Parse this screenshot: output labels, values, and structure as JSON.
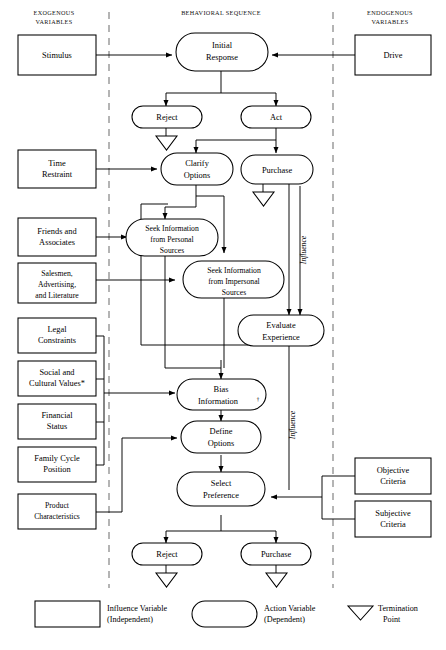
{
  "figure": {
    "columns": {
      "left_header_line1": "EXOGENOUS",
      "left_header_line2": "VARIABLES",
      "center_header": "BEHAVIORAL   SEQUENCE",
      "right_header_line1": "ENDOGENOUS",
      "right_header_line2": "VARIABLES"
    }
  },
  "exogenous_boxes": [
    {
      "id": "stimulus",
      "lines": [
        "Stimulus"
      ]
    },
    {
      "id": "time-restraint",
      "lines": [
        "Time",
        "Restraint"
      ]
    },
    {
      "id": "friends-associates",
      "lines": [
        "Friends  and",
        "Associates"
      ]
    },
    {
      "id": "salesmen-advertising",
      "lines": [
        "Salesmen,",
        "Advertising,",
        "and Literature"
      ]
    },
    {
      "id": "legal-constraints",
      "lines": [
        "Legal",
        "Constraints"
      ]
    },
    {
      "id": "social-cultural-values",
      "lines": [
        "Social  and",
        "Cultural  Values*"
      ]
    },
    {
      "id": "financial-status",
      "lines": [
        "Financial",
        "Status"
      ]
    },
    {
      "id": "family-cycle-position",
      "lines": [
        "Family  Cycle",
        "Position"
      ]
    },
    {
      "id": "product-characteristics",
      "lines": [
        "Product",
        "Characteristics"
      ]
    }
  ],
  "endogenous_boxes": [
    {
      "id": "drive",
      "lines": [
        "Drive"
      ]
    },
    {
      "id": "objective-criteria",
      "lines": [
        "Objective",
        "Criteria"
      ]
    },
    {
      "id": "subjective-criteria",
      "lines": [
        "Subjective",
        "Criteria"
      ]
    }
  ],
  "action_nodes": [
    {
      "id": "initial-response",
      "lines": [
        "Initial",
        "Response"
      ]
    },
    {
      "id": "reject-top",
      "lines": [
        "Reject"
      ]
    },
    {
      "id": "act",
      "lines": [
        "Act"
      ]
    },
    {
      "id": "clarify-options",
      "lines": [
        "Clarify",
        "Options"
      ]
    },
    {
      "id": "purchase-top",
      "lines": [
        "Purchase"
      ]
    },
    {
      "id": "seek-personal",
      "lines": [
        "Seek Information",
        "from  Personal",
        "Sources"
      ]
    },
    {
      "id": "seek-impersonal",
      "lines": [
        "Seek Information",
        "from  Impersonal",
        "Sources"
      ]
    },
    {
      "id": "evaluate-experience",
      "lines": [
        "Evaluate",
        "Experience"
      ]
    },
    {
      "id": "bias-information",
      "lines": [
        "Bias",
        "Information"
      ],
      "superscript": "†"
    },
    {
      "id": "define-options",
      "lines": [
        "Define",
        "Options"
      ]
    },
    {
      "id": "select-preference",
      "lines": [
        "Select",
        "Preference"
      ]
    },
    {
      "id": "reject-bottom",
      "lines": [
        "Reject"
      ]
    },
    {
      "id": "purchase-bottom",
      "lines": [
        "Purchase"
      ]
    }
  ],
  "edge_labels": {
    "influence_upper": "Influence",
    "influence_lower": "Influence"
  },
  "legend": [
    {
      "id": "influence-variable",
      "shape": "rect",
      "line1": "Influence Variable",
      "line2": "(Independent)"
    },
    {
      "id": "action-variable",
      "shape": "oval",
      "line1": "Action Variable",
      "line2": "(Dependent)"
    },
    {
      "id": "termination-point",
      "shape": "triangle",
      "line1": "Termination",
      "line2": "Point"
    }
  ],
  "colors": {
    "stroke": "#000000",
    "fill": "#ffffff",
    "divider": "#777777",
    "text": "#000000"
  }
}
